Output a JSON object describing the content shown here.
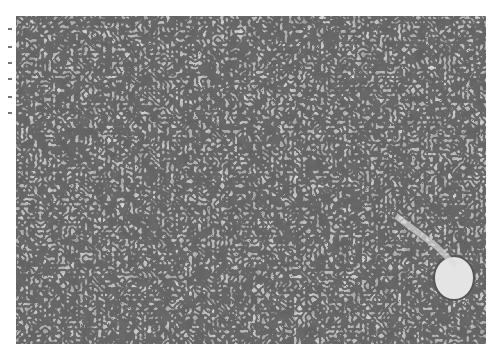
{
  "image": {
    "alt": "Grayscale histology micrograph of densely packed cells with dark nuclei and pale cytoplasm; a round pale vessel structure in the lower right",
    "colors": {
      "background": "#ffffff",
      "tissue_base": "#8a8a8a",
      "nucleus": "#1e1e1e",
      "cytoplasm": "#d2d2d2",
      "vessel": "#e6e6e6"
    }
  }
}
